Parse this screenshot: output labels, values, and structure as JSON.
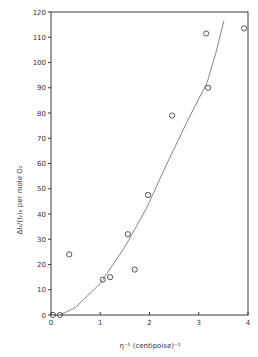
{
  "chart_data": {
    "type": "scatter",
    "title": "",
    "xlabel": "η⁻¹  (centipoise)⁻¹",
    "ylabel": "ΔI₂/(I₂)₀ per mole O₂",
    "xlim": [
      0,
      4
    ],
    "ylim": [
      0,
      120
    ],
    "x_ticks": [
      0,
      1,
      2,
      3,
      4
    ],
    "y_ticks": [
      0,
      10,
      20,
      30,
      40,
      50,
      60,
      70,
      80,
      90,
      100,
      110,
      120
    ],
    "grid": false,
    "legend": null,
    "series": [
      {
        "name": "measured",
        "marker": "open-circle",
        "points": [
          {
            "x": 0.04,
            "y": 0
          },
          {
            "x": 0.18,
            "y": 0
          },
          {
            "x": 0.37,
            "y": 24
          },
          {
            "x": 1.05,
            "y": 14
          },
          {
            "x": 1.2,
            "y": 15
          },
          {
            "x": 1.56,
            "y": 32
          },
          {
            "x": 1.7,
            "y": 18
          },
          {
            "x": 1.97,
            "y": 47.5
          },
          {
            "x": 2.46,
            "y": 79
          },
          {
            "x": 3.15,
            "y": 111.5
          },
          {
            "x": 3.19,
            "y": 90
          },
          {
            "x": 3.92,
            "y": 113.5
          }
        ]
      },
      {
        "name": "fitted curve",
        "marker": "line",
        "points": [
          {
            "x": 0.18,
            "y": 0
          },
          {
            "x": 0.5,
            "y": 3
          },
          {
            "x": 1.0,
            "y": 12.5
          },
          {
            "x": 1.5,
            "y": 27
          },
          {
            "x": 1.93,
            "y": 42
          },
          {
            "x": 2.38,
            "y": 61
          },
          {
            "x": 2.8,
            "y": 78
          },
          {
            "x": 3.17,
            "y": 92
          },
          {
            "x": 3.35,
            "y": 104
          },
          {
            "x": 3.51,
            "y": 116.5
          }
        ]
      }
    ]
  }
}
